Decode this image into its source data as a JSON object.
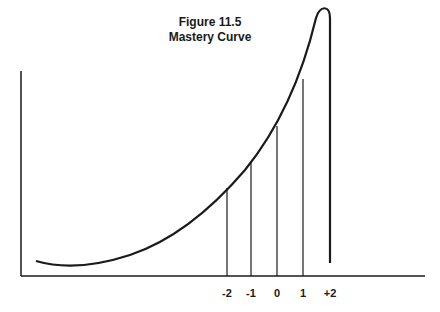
{
  "figure": {
    "number": "Figure 11.5",
    "title": "Mastery Curve"
  },
  "chart_data": {
    "type": "line",
    "title": "Mastery Curve",
    "figure_label": "Figure 11.5",
    "xlabel": "",
    "ylabel": "",
    "grid": false,
    "x_tick_labels": [
      "-2",
      "-1",
      "0",
      "1",
      "+2"
    ],
    "drop_lines_at": [
      "-2",
      "-1",
      "0",
      "1",
      "+2"
    ],
    "curve_description": "Accelerating (convex) mastery curve rising from a shallow minimum at low x to a peak just before +2, then dropping sharply vertically at +2",
    "colors": {
      "line": "#1a1a1a",
      "background": "#ffffff"
    }
  }
}
